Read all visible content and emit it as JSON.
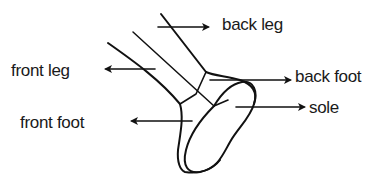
{
  "diagram": {
    "stroke_color": "#111111",
    "background": "#ffffff",
    "labels": [
      {
        "id": "back-leg",
        "text": "back leg",
        "x": 222,
        "y": 9,
        "arrow_dir": "right"
      },
      {
        "id": "front-leg",
        "text": "front leg",
        "x": 11,
        "y": 63,
        "arrow_dir": "left"
      },
      {
        "id": "back-foot",
        "text": "back foot",
        "x": 295,
        "y": 69,
        "arrow_dir": "right"
      },
      {
        "id": "sole",
        "text": "sole",
        "x": 309,
        "y": 101,
        "arrow_dir": "right"
      },
      {
        "id": "front-foot",
        "text": "front foot",
        "x": 20,
        "y": 114,
        "arrow_dir": "left"
      }
    ]
  }
}
